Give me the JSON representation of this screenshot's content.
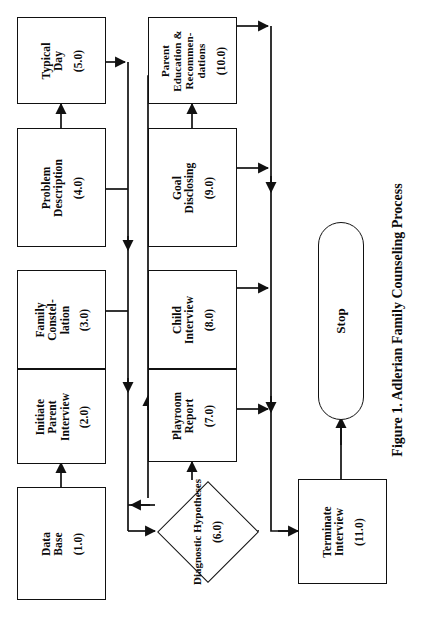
{
  "figure": {
    "caption": "Figure 1. Adlerian Family Counseling Process",
    "orientation": "rotated-90-ccw",
    "background_color": "#ffffff",
    "line_color": "#111111",
    "text_color": "#0a0a0a"
  },
  "nodes": [
    {
      "id": "n1",
      "shape": "rectangle",
      "line1": "Data",
      "line2": "Base",
      "line3": "",
      "code": "(1.0)"
    },
    {
      "id": "n2",
      "shape": "rectangle",
      "line1": "Initiate",
      "line2": "Parent",
      "line3": "Interview",
      "code": "(2.0)"
    },
    {
      "id": "n3",
      "shape": "rectangle",
      "line1": "Family",
      "line2": "Constel-",
      "line3": "lation",
      "code": "(3.0)"
    },
    {
      "id": "n4",
      "shape": "rectangle",
      "line1": "Problem",
      "line2": "Description",
      "line3": "",
      "code": "(4.0)"
    },
    {
      "id": "n5",
      "shape": "rectangle",
      "line1": "Typical",
      "line2": "Day",
      "line3": "",
      "code": "(5.0)"
    },
    {
      "id": "n6",
      "shape": "diamond",
      "line1": "Diagnostic",
      "line2": "Hypotheses",
      "line3": "",
      "code": "(6.0)"
    },
    {
      "id": "n7",
      "shape": "rectangle",
      "line1": "Playroom",
      "line2": "Report",
      "line3": "",
      "code": "(7.0)"
    },
    {
      "id": "n8",
      "shape": "rectangle",
      "line1": "Child",
      "line2": "Interview",
      "line3": "",
      "code": "(8.0)"
    },
    {
      "id": "n9",
      "shape": "rectangle",
      "line1": "Goal",
      "line2": "Disclosing",
      "line3": "",
      "code": "(9.0)"
    },
    {
      "id": "n10",
      "shape": "rectangle",
      "line1": "Parent",
      "line2": "Education &",
      "line3": "Recommen-",
      "line4": "dations",
      "code": "(10.0)"
    },
    {
      "id": "n11",
      "shape": "rectangle",
      "line1": "Terminate",
      "line2": "Interview",
      "line3": "",
      "code": "(11.0)"
    },
    {
      "id": "n12",
      "shape": "terminal",
      "line1": "Stop",
      "line2": "",
      "line3": "",
      "code": ""
    }
  ],
  "flow_sequence": [
    "Data Base (1.0)",
    "Initiate Parent Interview (2.0)",
    "Family Constel-lation (3.0)",
    "Problem Description (4.0)",
    "Typical Day (5.0)",
    "Diagnostic Hypotheses (6.0)",
    "Playroom Report (7.0)",
    "Child Interview (8.0)",
    "Goal Disclosing (9.0)",
    "Parent Education & Recommendations (10.0)",
    "Terminate Interview (11.0)",
    "Stop"
  ]
}
